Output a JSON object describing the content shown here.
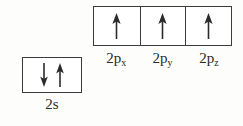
{
  "diagram": {
    "background_color": "#fdfdfc",
    "border_color": "#3b3b3b",
    "arrow_color": "#2b2b2b",
    "text_color": "#2a2a2a"
  },
  "orbitals": {
    "p_block": {
      "name": "2p-subshell",
      "cells": [
        {
          "label_base": "2p",
          "label_sub": "x",
          "label_full": "2px",
          "electrons": [
            {
              "spin": "up",
              "icon": "up-arrow-icon"
            }
          ]
        },
        {
          "label_base": "2p",
          "label_sub": "y",
          "label_full": "2py",
          "electrons": [
            {
              "spin": "up",
              "icon": "up-arrow-icon"
            }
          ]
        },
        {
          "label_base": "2p",
          "label_sub": "z",
          "label_full": "2pz",
          "electrons": [
            {
              "spin": "up",
              "icon": "up-arrow-icon"
            }
          ]
        }
      ]
    },
    "s_block": {
      "name": "2s-subshell",
      "cells": [
        {
          "label_base": "2s",
          "label_sub": "",
          "label_full": "2s",
          "electrons": [
            {
              "spin": "down",
              "icon": "down-arrow-icon"
            },
            {
              "spin": "up",
              "icon": "up-arrow-icon"
            }
          ]
        }
      ]
    }
  }
}
